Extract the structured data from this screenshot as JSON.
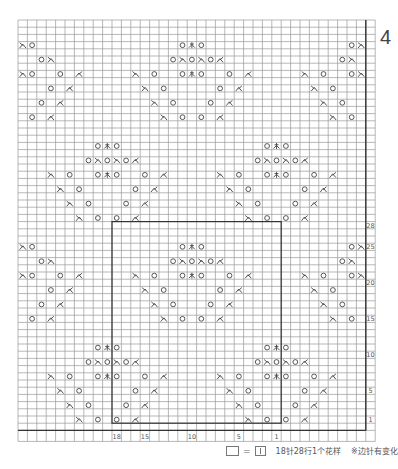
{
  "figure_number": "4",
  "grid": {
    "columns": 37,
    "rows": 57,
    "x0": 18,
    "y0": 20,
    "col_w": 9.4,
    "row_h": 7.2,
    "grid_color": "#9a9a9a",
    "thick_color": "#333333"
  },
  "repeat_box": {
    "col_start": 10,
    "col_end": 27,
    "row_start": 28,
    "row_end": 55
  },
  "row_labels": [
    {
      "row": 28,
      "text": "28"
    },
    {
      "row": 31,
      "text": "25"
    },
    {
      "row": 36,
      "text": "20"
    },
    {
      "row": 41,
      "text": "15"
    },
    {
      "row": 46,
      "text": "10"
    },
    {
      "row": 51,
      "text": "5"
    },
    {
      "row": 55,
      "text": "1"
    }
  ],
  "column_labels": [
    {
      "col": 10,
      "text": "18"
    },
    {
      "col": 13,
      "text": "15"
    },
    {
      "col": 18,
      "text": "10"
    },
    {
      "col": 23,
      "text": "5"
    },
    {
      "col": 27,
      "text": "1"
    }
  ],
  "symbol_glyphs": {
    "yo": "O",
    "k2tog_right": "入",
    "k2tog_left": "人",
    "cdd": "木"
  },
  "symbols": [
    {
      "r": 3,
      "c": 0,
      "s": "k2tog_right"
    },
    {
      "r": 3,
      "c": 1,
      "s": "yo"
    },
    {
      "r": 3,
      "c": 17,
      "s": "yo"
    },
    {
      "r": 3,
      "c": 18,
      "s": "cdd"
    },
    {
      "r": 3,
      "c": 19,
      "s": "yo"
    },
    {
      "r": 3,
      "c": 35,
      "s": "yo"
    },
    {
      "r": 3,
      "c": 36,
      "s": "k2tog_right"
    },
    {
      "r": 5,
      "c": 2,
      "s": "yo"
    },
    {
      "r": 5,
      "c": 3,
      "s": "k2tog_right"
    },
    {
      "r": 5,
      "c": 16,
      "s": "yo"
    },
    {
      "r": 5,
      "c": 17,
      "s": "k2tog_right"
    },
    {
      "r": 5,
      "c": 18,
      "s": "yo"
    },
    {
      "r": 5,
      "c": 19,
      "s": "k2tog_right"
    },
    {
      "r": 5,
      "c": 20,
      "s": "yo"
    },
    {
      "r": 5,
      "c": 21,
      "s": "k2tog_left"
    },
    {
      "r": 5,
      "c": 34,
      "s": "yo"
    },
    {
      "r": 5,
      "c": 35,
      "s": "k2tog_right"
    },
    {
      "r": 7,
      "c": 0,
      "s": "k2tog_right"
    },
    {
      "r": 7,
      "c": 1,
      "s": "yo"
    },
    {
      "r": 7,
      "c": 4,
      "s": "yo"
    },
    {
      "r": 7,
      "c": 6,
      "s": "k2tog_left"
    },
    {
      "r": 7,
      "c": 12,
      "s": "k2tog_right"
    },
    {
      "r": 7,
      "c": 14,
      "s": "yo"
    },
    {
      "r": 7,
      "c": 17,
      "s": "yo"
    },
    {
      "r": 7,
      "c": 18,
      "s": "cdd"
    },
    {
      "r": 7,
      "c": 19,
      "s": "yo"
    },
    {
      "r": 7,
      "c": 22,
      "s": "yo"
    },
    {
      "r": 7,
      "c": 24,
      "s": "k2tog_left"
    },
    {
      "r": 7,
      "c": 30,
      "s": "k2tog_right"
    },
    {
      "r": 7,
      "c": 32,
      "s": "yo"
    },
    {
      "r": 7,
      "c": 35,
      "s": "yo"
    },
    {
      "r": 7,
      "c": 36,
      "s": "k2tog_right"
    },
    {
      "r": 9,
      "c": 3,
      "s": "yo"
    },
    {
      "r": 9,
      "c": 5,
      "s": "k2tog_left"
    },
    {
      "r": 9,
      "c": 13,
      "s": "k2tog_right"
    },
    {
      "r": 9,
      "c": 15,
      "s": "yo"
    },
    {
      "r": 9,
      "c": 21,
      "s": "yo"
    },
    {
      "r": 9,
      "c": 23,
      "s": "k2tog_left"
    },
    {
      "r": 9,
      "c": 31,
      "s": "k2tog_right"
    },
    {
      "r": 9,
      "c": 33,
      "s": "yo"
    },
    {
      "r": 11,
      "c": 2,
      "s": "yo"
    },
    {
      "r": 11,
      "c": 4,
      "s": "k2tog_left"
    },
    {
      "r": 11,
      "c": 14,
      "s": "k2tog_right"
    },
    {
      "r": 11,
      "c": 16,
      "s": "yo"
    },
    {
      "r": 11,
      "c": 20,
      "s": "yo"
    },
    {
      "r": 11,
      "c": 22,
      "s": "k2tog_left"
    },
    {
      "r": 11,
      "c": 32,
      "s": "k2tog_right"
    },
    {
      "r": 11,
      "c": 34,
      "s": "yo"
    },
    {
      "r": 13,
      "c": 1,
      "s": "yo"
    },
    {
      "r": 13,
      "c": 3,
      "s": "k2tog_left"
    },
    {
      "r": 13,
      "c": 15,
      "s": "k2tog_right"
    },
    {
      "r": 13,
      "c": 17,
      "s": "yo"
    },
    {
      "r": 13,
      "c": 19,
      "s": "yo"
    },
    {
      "r": 13,
      "c": 21,
      "s": "k2tog_left"
    },
    {
      "r": 13,
      "c": 33,
      "s": "k2tog_right"
    },
    {
      "r": 13,
      "c": 35,
      "s": "yo"
    },
    {
      "r": 17,
      "c": 8,
      "s": "yo"
    },
    {
      "r": 17,
      "c": 9,
      "s": "cdd"
    },
    {
      "r": 17,
      "c": 10,
      "s": "yo"
    },
    {
      "r": 17,
      "c": 26,
      "s": "yo"
    },
    {
      "r": 17,
      "c": 27,
      "s": "cdd"
    },
    {
      "r": 17,
      "c": 28,
      "s": "yo"
    },
    {
      "r": 19,
      "c": 7,
      "s": "yo"
    },
    {
      "r": 19,
      "c": 8,
      "s": "k2tog_right"
    },
    {
      "r": 19,
      "c": 9,
      "s": "yo"
    },
    {
      "r": 19,
      "c": 10,
      "s": "k2tog_right"
    },
    {
      "r": 19,
      "c": 11,
      "s": "yo"
    },
    {
      "r": 19,
      "c": 12,
      "s": "k2tog_left"
    },
    {
      "r": 19,
      "c": 25,
      "s": "yo"
    },
    {
      "r": 19,
      "c": 26,
      "s": "k2tog_right"
    },
    {
      "r": 19,
      "c": 27,
      "s": "yo"
    },
    {
      "r": 19,
      "c": 28,
      "s": "k2tog_right"
    },
    {
      "r": 19,
      "c": 29,
      "s": "yo"
    },
    {
      "r": 19,
      "c": 30,
      "s": "k2tog_left"
    },
    {
      "r": 21,
      "c": 3,
      "s": "k2tog_right"
    },
    {
      "r": 21,
      "c": 5,
      "s": "yo"
    },
    {
      "r": 21,
      "c": 8,
      "s": "yo"
    },
    {
      "r": 21,
      "c": 9,
      "s": "cdd"
    },
    {
      "r": 21,
      "c": 10,
      "s": "yo"
    },
    {
      "r": 21,
      "c": 13,
      "s": "yo"
    },
    {
      "r": 21,
      "c": 15,
      "s": "k2tog_left"
    },
    {
      "r": 21,
      "c": 21,
      "s": "k2tog_right"
    },
    {
      "r": 21,
      "c": 23,
      "s": "yo"
    },
    {
      "r": 21,
      "c": 26,
      "s": "yo"
    },
    {
      "r": 21,
      "c": 27,
      "s": "cdd"
    },
    {
      "r": 21,
      "c": 28,
      "s": "yo"
    },
    {
      "r": 21,
      "c": 31,
      "s": "yo"
    },
    {
      "r": 21,
      "c": 33,
      "s": "k2tog_left"
    },
    {
      "r": 23,
      "c": 4,
      "s": "k2tog_right"
    },
    {
      "r": 23,
      "c": 6,
      "s": "yo"
    },
    {
      "r": 23,
      "c": 12,
      "s": "yo"
    },
    {
      "r": 23,
      "c": 14,
      "s": "k2tog_left"
    },
    {
      "r": 23,
      "c": 22,
      "s": "k2tog_right"
    },
    {
      "r": 23,
      "c": 24,
      "s": "yo"
    },
    {
      "r": 23,
      "c": 30,
      "s": "yo"
    },
    {
      "r": 23,
      "c": 32,
      "s": "k2tog_left"
    },
    {
      "r": 25,
      "c": 5,
      "s": "k2tog_right"
    },
    {
      "r": 25,
      "c": 7,
      "s": "yo"
    },
    {
      "r": 25,
      "c": 11,
      "s": "yo"
    },
    {
      "r": 25,
      "c": 13,
      "s": "k2tog_left"
    },
    {
      "r": 25,
      "c": 23,
      "s": "k2tog_right"
    },
    {
      "r": 25,
      "c": 25,
      "s": "yo"
    },
    {
      "r": 25,
      "c": 29,
      "s": "yo"
    },
    {
      "r": 25,
      "c": 31,
      "s": "k2tog_left"
    },
    {
      "r": 27,
      "c": 6,
      "s": "k2tog_right"
    },
    {
      "r": 27,
      "c": 8,
      "s": "yo"
    },
    {
      "r": 27,
      "c": 10,
      "s": "yo"
    },
    {
      "r": 27,
      "c": 12,
      "s": "k2tog_left"
    },
    {
      "r": 27,
      "c": 24,
      "s": "k2tog_right"
    },
    {
      "r": 27,
      "c": 26,
      "s": "yo"
    },
    {
      "r": 27,
      "c": 28,
      "s": "yo"
    },
    {
      "r": 27,
      "c": 30,
      "s": "k2tog_left"
    },
    {
      "r": 31,
      "c": 0,
      "s": "k2tog_right"
    },
    {
      "r": 31,
      "c": 1,
      "s": "yo"
    },
    {
      "r": 31,
      "c": 17,
      "s": "yo"
    },
    {
      "r": 31,
      "c": 18,
      "s": "cdd"
    },
    {
      "r": 31,
      "c": 19,
      "s": "yo"
    },
    {
      "r": 31,
      "c": 35,
      "s": "yo"
    },
    {
      "r": 31,
      "c": 36,
      "s": "k2tog_right"
    },
    {
      "r": 33,
      "c": 2,
      "s": "yo"
    },
    {
      "r": 33,
      "c": 3,
      "s": "k2tog_right"
    },
    {
      "r": 33,
      "c": 16,
      "s": "yo"
    },
    {
      "r": 33,
      "c": 17,
      "s": "k2tog_right"
    },
    {
      "r": 33,
      "c": 18,
      "s": "yo"
    },
    {
      "r": 33,
      "c": 19,
      "s": "k2tog_right"
    },
    {
      "r": 33,
      "c": 20,
      "s": "yo"
    },
    {
      "r": 33,
      "c": 21,
      "s": "k2tog_left"
    },
    {
      "r": 33,
      "c": 34,
      "s": "yo"
    },
    {
      "r": 33,
      "c": 35,
      "s": "k2tog_right"
    },
    {
      "r": 35,
      "c": 0,
      "s": "k2tog_right"
    },
    {
      "r": 35,
      "c": 1,
      "s": "yo"
    },
    {
      "r": 35,
      "c": 4,
      "s": "yo"
    },
    {
      "r": 35,
      "c": 6,
      "s": "k2tog_left"
    },
    {
      "r": 35,
      "c": 12,
      "s": "k2tog_right"
    },
    {
      "r": 35,
      "c": 14,
      "s": "yo"
    },
    {
      "r": 35,
      "c": 17,
      "s": "yo"
    },
    {
      "r": 35,
      "c": 18,
      "s": "cdd"
    },
    {
      "r": 35,
      "c": 19,
      "s": "yo"
    },
    {
      "r": 35,
      "c": 22,
      "s": "yo"
    },
    {
      "r": 35,
      "c": 24,
      "s": "k2tog_left"
    },
    {
      "r": 35,
      "c": 30,
      "s": "k2tog_right"
    },
    {
      "r": 35,
      "c": 32,
      "s": "yo"
    },
    {
      "r": 35,
      "c": 35,
      "s": "yo"
    },
    {
      "r": 35,
      "c": 36,
      "s": "k2tog_right"
    },
    {
      "r": 37,
      "c": 3,
      "s": "yo"
    },
    {
      "r": 37,
      "c": 5,
      "s": "k2tog_left"
    },
    {
      "r": 37,
      "c": 13,
      "s": "k2tog_right"
    },
    {
      "r": 37,
      "c": 15,
      "s": "yo"
    },
    {
      "r": 37,
      "c": 21,
      "s": "yo"
    },
    {
      "r": 37,
      "c": 23,
      "s": "k2tog_left"
    },
    {
      "r": 37,
      "c": 31,
      "s": "k2tog_right"
    },
    {
      "r": 37,
      "c": 33,
      "s": "yo"
    },
    {
      "r": 39,
      "c": 2,
      "s": "yo"
    },
    {
      "r": 39,
      "c": 4,
      "s": "k2tog_left"
    },
    {
      "r": 39,
      "c": 14,
      "s": "k2tog_right"
    },
    {
      "r": 39,
      "c": 16,
      "s": "yo"
    },
    {
      "r": 39,
      "c": 20,
      "s": "yo"
    },
    {
      "r": 39,
      "c": 22,
      "s": "k2tog_left"
    },
    {
      "r": 39,
      "c": 32,
      "s": "k2tog_right"
    },
    {
      "r": 39,
      "c": 34,
      "s": "yo"
    },
    {
      "r": 41,
      "c": 1,
      "s": "yo"
    },
    {
      "r": 41,
      "c": 3,
      "s": "k2tog_left"
    },
    {
      "r": 41,
      "c": 15,
      "s": "k2tog_right"
    },
    {
      "r": 41,
      "c": 17,
      "s": "yo"
    },
    {
      "r": 41,
      "c": 19,
      "s": "yo"
    },
    {
      "r": 41,
      "c": 21,
      "s": "k2tog_left"
    },
    {
      "r": 41,
      "c": 33,
      "s": "k2tog_right"
    },
    {
      "r": 41,
      "c": 35,
      "s": "yo"
    },
    {
      "r": 45,
      "c": 8,
      "s": "yo"
    },
    {
      "r": 45,
      "c": 9,
      "s": "cdd"
    },
    {
      "r": 45,
      "c": 10,
      "s": "yo"
    },
    {
      "r": 45,
      "c": 26,
      "s": "yo"
    },
    {
      "r": 45,
      "c": 27,
      "s": "cdd"
    },
    {
      "r": 45,
      "c": 28,
      "s": "yo"
    },
    {
      "r": 47,
      "c": 7,
      "s": "yo"
    },
    {
      "r": 47,
      "c": 8,
      "s": "k2tog_right"
    },
    {
      "r": 47,
      "c": 9,
      "s": "yo"
    },
    {
      "r": 47,
      "c": 10,
      "s": "k2tog_right"
    },
    {
      "r": 47,
      "c": 11,
      "s": "yo"
    },
    {
      "r": 47,
      "c": 12,
      "s": "k2tog_left"
    },
    {
      "r": 47,
      "c": 25,
      "s": "yo"
    },
    {
      "r": 47,
      "c": 26,
      "s": "k2tog_right"
    },
    {
      "r": 47,
      "c": 27,
      "s": "yo"
    },
    {
      "r": 47,
      "c": 28,
      "s": "k2tog_right"
    },
    {
      "r": 47,
      "c": 29,
      "s": "yo"
    },
    {
      "r": 47,
      "c": 30,
      "s": "k2tog_left"
    },
    {
      "r": 49,
      "c": 3,
      "s": "k2tog_right"
    },
    {
      "r": 49,
      "c": 5,
      "s": "yo"
    },
    {
      "r": 49,
      "c": 8,
      "s": "yo"
    },
    {
      "r": 49,
      "c": 9,
      "s": "cdd"
    },
    {
      "r": 49,
      "c": 10,
      "s": "yo"
    },
    {
      "r": 49,
      "c": 13,
      "s": "yo"
    },
    {
      "r": 49,
      "c": 15,
      "s": "k2tog_left"
    },
    {
      "r": 49,
      "c": 21,
      "s": "k2tog_right"
    },
    {
      "r": 49,
      "c": 23,
      "s": "yo"
    },
    {
      "r": 49,
      "c": 26,
      "s": "yo"
    },
    {
      "r": 49,
      "c": 27,
      "s": "cdd"
    },
    {
      "r": 49,
      "c": 28,
      "s": "yo"
    },
    {
      "r": 49,
      "c": 31,
      "s": "yo"
    },
    {
      "r": 49,
      "c": 33,
      "s": "k2tog_left"
    },
    {
      "r": 51,
      "c": 4,
      "s": "k2tog_right"
    },
    {
      "r": 51,
      "c": 6,
      "s": "yo"
    },
    {
      "r": 51,
      "c": 12,
      "s": "yo"
    },
    {
      "r": 51,
      "c": 14,
      "s": "k2tog_left"
    },
    {
      "r": 51,
      "c": 22,
      "s": "k2tog_right"
    },
    {
      "r": 51,
      "c": 24,
      "s": "yo"
    },
    {
      "r": 51,
      "c": 30,
      "s": "yo"
    },
    {
      "r": 51,
      "c": 32,
      "s": "k2tog_left"
    },
    {
      "r": 53,
      "c": 5,
      "s": "k2tog_right"
    },
    {
      "r": 53,
      "c": 7,
      "s": "yo"
    },
    {
      "r": 53,
      "c": 11,
      "s": "yo"
    },
    {
      "r": 53,
      "c": 13,
      "s": "k2tog_left"
    },
    {
      "r": 53,
      "c": 23,
      "s": "k2tog_right"
    },
    {
      "r": 53,
      "c": 25,
      "s": "yo"
    },
    {
      "r": 53,
      "c": 29,
      "s": "yo"
    },
    {
      "r": 53,
      "c": 31,
      "s": "k2tog_left"
    },
    {
      "r": 55,
      "c": 6,
      "s": "k2tog_right"
    },
    {
      "r": 55,
      "c": 8,
      "s": "yo"
    },
    {
      "r": 55,
      "c": 10,
      "s": "yo"
    },
    {
      "r": 55,
      "c": 12,
      "s": "k2tog_left"
    },
    {
      "r": 55,
      "c": 24,
      "s": "k2tog_right"
    },
    {
      "r": 55,
      "c": 26,
      "s": "yo"
    },
    {
      "r": 55,
      "c": 28,
      "s": "yo"
    },
    {
      "r": 55,
      "c": 30,
      "s": "k2tog_left"
    }
  ],
  "legend": {
    "equals": "=",
    "repeat_text": "18针28行1个花样",
    "note": "※边针有变化"
  }
}
